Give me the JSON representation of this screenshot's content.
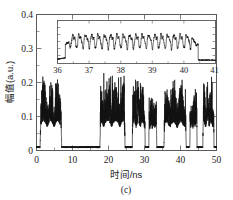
{
  "chart_data": {
    "type": "line",
    "title": "",
    "caption": "(c)",
    "xlabel": "时间/ns",
    "ylabel": "幅值(a.u.)",
    "xlim": [
      0,
      50
    ],
    "ylim": [
      0,
      0.4
    ],
    "xticks": [
      0,
      10,
      20,
      30,
      40,
      50
    ],
    "xtick_labels": [
      "0",
      "10",
      "20",
      "30",
      "40",
      "50"
    ],
    "yticks": [
      0,
      0.1,
      0.2,
      0.3,
      0.4
    ],
    "ytick_labels": [
      "0",
      "0.1",
      "0.2",
      "0.3",
      "0.4"
    ],
    "grid": false,
    "legend": null,
    "series": [
      {
        "name": "amplitude",
        "description": "noisy chaotic burst waveform, baseline near 0.010, bursts peak 0.10-0.17",
        "baseline": 0.01,
        "burst_intervals": [
          [
            1.0,
            7.0
          ],
          [
            17.6,
            24.6
          ],
          [
            26.6,
            30.2
          ],
          [
            31.2,
            33.4
          ],
          [
            35.4,
            41.6
          ],
          [
            42.6,
            44.6
          ],
          [
            46.2,
            49.3
          ]
        ],
        "burst_peaks": [
          0.165,
          0.168,
          0.152,
          0.118,
          0.152,
          0.128,
          0.158
        ],
        "burst_mean": 0.09
      }
    ],
    "inset": {
      "type": "line",
      "xlim": [
        36,
        41
      ],
      "ylim": [
        0.235,
        0.36
      ],
      "xticks": [
        36,
        37,
        38,
        39,
        40,
        41
      ],
      "xtick_labels": [
        "36",
        "37",
        "38",
        "39",
        "40",
        "41"
      ],
      "xlabel": "",
      "ylabel": "",
      "description": "zoom of burst between 36 and 41 ns showing fast oscillation around 0.30",
      "baseline_left": 0.247,
      "baseline_right": 0.245,
      "oscillation_center": 0.302,
      "oscillation_amplitude": 0.032,
      "oscillation_cycles": 21,
      "rise_start": 36.25,
      "fall_end": 40.45
    }
  }
}
